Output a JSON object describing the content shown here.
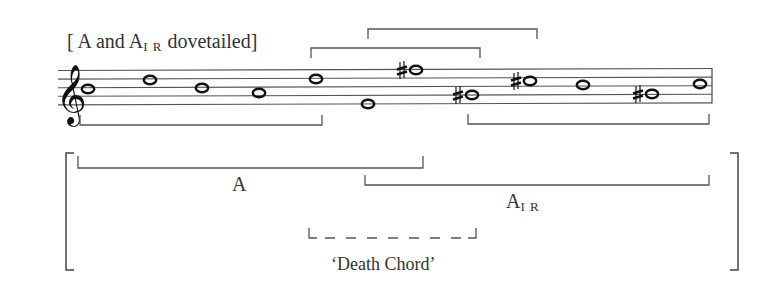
{
  "title_parts": {
    "open": "[ A and A",
    "sub": "I R",
    "close": " dovetailed]"
  },
  "clef": "treble",
  "staff": {
    "left": 58,
    "right": 712,
    "top": 70,
    "spacing": 8.6,
    "barline_right": true
  },
  "notes": [
    {
      "index": 1,
      "pitch": "B4",
      "accidental": "",
      "x": 88,
      "y": 89
    },
    {
      "index": 2,
      "pitch": "D5",
      "accidental": "",
      "x": 150,
      "y": 80
    },
    {
      "index": 3,
      "pitch": "B4",
      "accidental": "",
      "x": 202,
      "y": 88
    },
    {
      "index": 4,
      "pitch": "A4",
      "accidental": "",
      "x": 259,
      "y": 93
    },
    {
      "index": 5,
      "pitch": "D5",
      "accidental": "",
      "x": 316,
      "y": 79
    },
    {
      "index": 6,
      "pitch": "E4",
      "accidental": "",
      "x": 368,
      "y": 104
    },
    {
      "index": 7,
      "pitch": "F#5",
      "accidental": "sharp",
      "x": 416,
      "y": 70
    },
    {
      "index": 8,
      "pitch": "G#4",
      "accidental": "sharp",
      "x": 472,
      "y": 95
    },
    {
      "index": 9,
      "pitch": "C#5",
      "accidental": "sharp",
      "x": 530,
      "y": 81
    },
    {
      "index": 10,
      "pitch": "C5",
      "accidental": "",
      "x": 583,
      "y": 85
    },
    {
      "index": 11,
      "pitch": "G#4",
      "accidental": "sharp",
      "x": 652,
      "y": 94
    },
    {
      "index": 12,
      "pitch": "C5",
      "accidental": "",
      "x": 700,
      "y": 84
    }
  ],
  "brackets_above": [
    {
      "x1": 311,
      "x2": 480,
      "y": 48,
      "depth": 10
    },
    {
      "x1": 368,
      "x2": 537,
      "y": 29,
      "depth": 10
    }
  ],
  "brackets_below_staff": [
    {
      "x1": 80,
      "x2": 322,
      "y": 125,
      "depth": 10
    },
    {
      "x1": 468,
      "x2": 709,
      "y": 124,
      "depth": 10
    }
  ],
  "lower_group": {
    "outer_bracket": {
      "x1": 66,
      "x2": 738,
      "top": 153,
      "bottom": 270
    },
    "segments": [
      {
        "name": "A",
        "label": "A",
        "x1": 78,
        "x2": 423,
        "y": 168,
        "depth": 12,
        "dashed": false,
        "label_x": 232,
        "label_y": 174
      },
      {
        "name": "A_IR",
        "label_main": "A",
        "label_sub": "I R",
        "x1": 365,
        "x2": 709,
        "y": 185,
        "depth": 10,
        "dashed": false,
        "label_x": 508,
        "label_y": 190
      },
      {
        "name": "death-chord",
        "label": "‘Death Chord’",
        "x1": 309,
        "x2": 476,
        "y": 238,
        "depth": 10,
        "dashed": true,
        "label_x": 331,
        "label_y": 254
      }
    ]
  },
  "colors": {
    "ink": "#333333",
    "lines": "#555555",
    "background": "#ffffff"
  }
}
